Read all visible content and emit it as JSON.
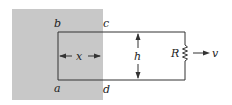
{
  "diagram": {
    "region_color": "#c8c8c8",
    "line_color": "#333333",
    "labels": {
      "b": "b",
      "c": "c",
      "a": "a",
      "d": "d",
      "x": "x",
      "h": "h",
      "R": "R",
      "v": "v"
    }
  }
}
